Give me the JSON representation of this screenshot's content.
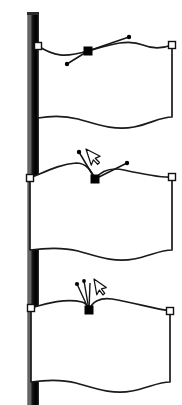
{
  "figure": {
    "title": "Flag shape with Bezier node handles",
    "caption": "",
    "background_color": "#ffffff",
    "stroke_color": "#1a1a1a",
    "fill_color": "#ffffff"
  },
  "pole": {
    "name": "flagpole",
    "x": 27,
    "width": 12,
    "top": 12,
    "bottom": 405,
    "highlight_color": "#6e6e6e",
    "shadow_color": "#000000",
    "edge_color": "#b4b4b4"
  },
  "panels": [
    {
      "id": "panel-top",
      "label": "Smooth node with symmetric handles",
      "node_state": "smooth",
      "node_style": "filled-square",
      "node_color": "#000000",
      "node": {
        "x": 88,
        "y": 51
      },
      "anchors": [
        {
          "name": "anchor-top-left",
          "x": 38,
          "y": 46,
          "style": "hollow-square"
        },
        {
          "name": "anchor-top-right",
          "x": 172,
          "y": 45,
          "style": "hollow-square"
        }
      ],
      "handles": [
        {
          "name": "handle-in",
          "x": 67,
          "y": 64
        },
        {
          "name": "handle-out",
          "x": 129,
          "y": 37
        }
      ],
      "cursor": null,
      "flag": {
        "top": "M 38,46 C 54,56 64,58 88,51 C 112,44 128,39 143,45 C 155,50 164,48 172,45",
        "right": "L 172,117",
        "bottom": "C 160,117 150,124 134,127 C 114,131 96,124 78,119 C 62,115 50,116 38,118",
        "left": "L 38,46"
      }
    },
    {
      "id": "panel-middle",
      "label": "Cusp node with independent handles",
      "node_state": "cusp",
      "node_style": "filled-square",
      "node_color": "#000000",
      "node": {
        "x": 95,
        "y": 179
      },
      "anchors": [
        {
          "name": "anchor-middle-left",
          "x": 30,
          "y": 178,
          "style": "hollow-square"
        },
        {
          "name": "anchor-middle-right",
          "x": 172,
          "y": 177,
          "style": "hollow-square"
        }
      ],
      "handles": [
        {
          "name": "handle-in",
          "x": 79,
          "y": 152
        },
        {
          "name": "handle-out",
          "x": 127,
          "y": 163
        }
      ],
      "cursor": {
        "name": "pointer-cursor",
        "x": 86,
        "y": 149,
        "rotation": -18
      },
      "flag": {
        "top": "M 30,178 C 45,172 60,164 76,163 C 86,163 91,170 95,179 C 101,171 110,167 124,170 C 142,174 160,178 172,177",
        "right": "L 172,250",
        "bottom": "C 160,250 150,256 134,259 C 114,263 96,256 78,251 C 62,247 46,248 30,250",
        "left": "L 30,178"
      }
    },
    {
      "id": "panel-bottom",
      "label": "Retracted handles forming sharp point",
      "node_state": "retracted",
      "node_style": "filled-square",
      "node_color": "#000000",
      "node": {
        "x": 89,
        "y": 310
      },
      "anchors": [
        {
          "name": "anchor-bottom-left",
          "x": 31,
          "y": 308,
          "style": "hollow-square"
        },
        {
          "name": "anchor-bottom-right",
          "x": 170,
          "y": 311,
          "style": "hollow-square"
        }
      ],
      "handles": [
        {
          "name": "handle-in",
          "x": 77,
          "y": 284
        },
        {
          "name": "handle-out",
          "x": 84,
          "y": 281
        }
      ],
      "cursor": {
        "name": "pointer-cursor",
        "x": 94,
        "y": 279,
        "rotation": -10
      },
      "flag": {
        "top": "M 31,308 C 48,303 66,298 82,302 C 86,303 88,306 89,310 C 92,302 100,297 112,299 C 134,303 156,309 170,311",
        "right": "L 170,382",
        "bottom": "C 158,382 148,388 132,391 C 112,395 94,388 76,383 C 60,379 46,380 31,382",
        "left": "L 31,308"
      }
    }
  ]
}
